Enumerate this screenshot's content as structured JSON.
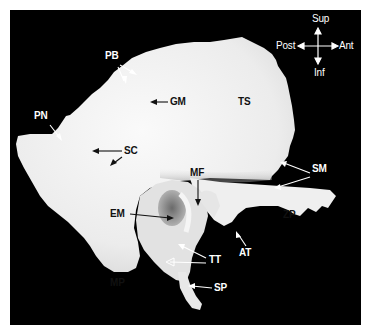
{
  "figure": {
    "orientation": {
      "sup": "Sup",
      "inf": "Inf",
      "post": "Post",
      "ant": "Ant"
    },
    "labels": {
      "pb": "PB",
      "pn": "PN",
      "gm": "GM",
      "ts": "TS",
      "sc": "SC",
      "sm": "SM",
      "mf": "MF",
      "em": "EM",
      "zp": "ZP",
      "mp": "MP",
      "tt": "TT",
      "at": "AT",
      "sp": "SP"
    },
    "colors": {
      "background": "#000000",
      "border": "#ffffff",
      "bone": "#f2f2f2",
      "dark_label": "#111111",
      "light_label": "#ffffff"
    }
  }
}
